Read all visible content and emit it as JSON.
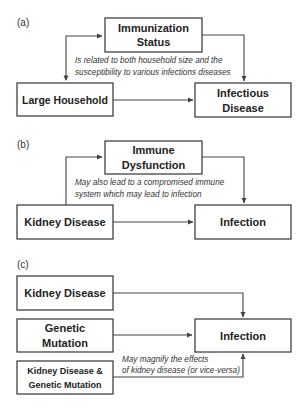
{
  "panels": {
    "a": {
      "label": "(a)",
      "top_box": {
        "line1": "Immunization",
        "line2": "Status"
      },
      "left_box": {
        "label": "Large Household"
      },
      "right_box": {
        "line1": "Infectious",
        "line2": "Disease"
      },
      "note": {
        "line1": "Is related to both household size and the",
        "line2": "susceptibility to various infections diseases"
      }
    },
    "b": {
      "label": "(b)",
      "top_box": {
        "line1": "Immune",
        "line2": "Dysfunction"
      },
      "left_box": {
        "label": "Kidney Disease"
      },
      "right_box": {
        "label": "Infection"
      },
      "note": {
        "line1": "May also lead to a compromised immune",
        "line2": "system which may lead to infection"
      }
    },
    "c": {
      "label": "(c)",
      "box1": {
        "label": "Kidney Disease"
      },
      "box2": {
        "line1": "Genetic",
        "line2": "Mutation"
      },
      "box3": {
        "line1": "Kidney Disease &",
        "line2": "Genetic Mutation"
      },
      "right_box": {
        "label": "Infection"
      },
      "note": {
        "line1": "May magnify the effects",
        "line2": "of kidney disease (or vice-versa)"
      }
    }
  }
}
